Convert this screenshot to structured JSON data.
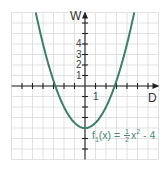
{
  "chart_data": {
    "type": "line",
    "title": "",
    "xlabel": "D",
    "ylabel": "W",
    "xlim": [
      -7,
      7
    ],
    "ylim": [
      -7,
      7
    ],
    "grid": true,
    "x_tick_labels": [
      "1"
    ],
    "y_tick_labels": [
      "1",
      "2",
      "3",
      "4"
    ],
    "series": [
      {
        "name": "f1(x) = 1/2 x^2 - 4",
        "formula": "0.5*x^2 - 4",
        "color": "#3d7f6a",
        "x": [
          -4.69,
          -4,
          -3,
          -2.83,
          -2,
          -1,
          0,
          1,
          2,
          2.83,
          3,
          4,
          4.69
        ],
        "y": [
          7,
          4,
          0.5,
          0,
          -2,
          -3.5,
          -4,
          -3.5,
          -2,
          0,
          0.5,
          4,
          7
        ]
      }
    ],
    "annotations": [
      {
        "text": "f1(x) = 1/2 x² - 4",
        "x": 2.2,
        "y": -4.5
      }
    ]
  },
  "axes": {
    "x_label": "D",
    "y_label": "W",
    "x_tick_one": "1",
    "y_ticks": [
      "4",
      "3",
      "2",
      "1"
    ]
  },
  "function_label": {
    "f": "f",
    "sub": "1",
    "arg": "(x) = ",
    "num": "1",
    "den": "2",
    "var": "x",
    "exp": "2",
    "rest": " - 4"
  },
  "colors": {
    "curve": "#3d7f6a",
    "label": "#4a8a78",
    "grid": "#d9d9d9",
    "axis": "#222222"
  }
}
